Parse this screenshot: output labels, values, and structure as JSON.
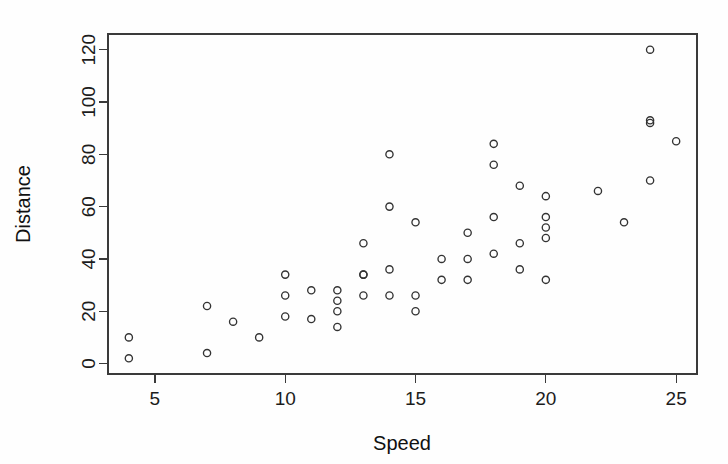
{
  "chart_data": {
    "type": "scatter",
    "title": "",
    "xlabel": "Speed",
    "ylabel": "Distance",
    "xlim": [
      3.2,
      25.8
    ],
    "ylim": [
      -4,
      126
    ],
    "grid": false,
    "legend": null,
    "marker": "open-circle",
    "marker_color": "#333333",
    "x_ticks": [
      5,
      10,
      15,
      20,
      25
    ],
    "x_tick_labels": [
      "5",
      "10",
      "15",
      "20",
      "25"
    ],
    "y_ticks": [
      0,
      20,
      40,
      60,
      80,
      100,
      120
    ],
    "y_tick_labels": [
      "0",
      "20",
      "40",
      "60",
      "80",
      "100",
      "120"
    ],
    "x": [
      4,
      4,
      7,
      7,
      8,
      9,
      10,
      10,
      10,
      11,
      11,
      12,
      12,
      12,
      12,
      13,
      13,
      13,
      13,
      14,
      14,
      14,
      14,
      15,
      15,
      15,
      16,
      16,
      17,
      17,
      17,
      18,
      18,
      18,
      18,
      19,
      19,
      19,
      20,
      20,
      20,
      20,
      20,
      22,
      23,
      24,
      24,
      24,
      24,
      25
    ],
    "y": [
      2,
      10,
      4,
      22,
      16,
      10,
      18,
      26,
      34,
      17,
      28,
      14,
      20,
      24,
      28,
      26,
      34,
      34,
      46,
      26,
      36,
      60,
      80,
      20,
      26,
      54,
      32,
      40,
      32,
      40,
      50,
      42,
      56,
      76,
      84,
      36,
      46,
      68,
      32,
      48,
      52,
      56,
      64,
      66,
      54,
      70,
      92,
      93,
      120,
      85
    ],
    "points": [
      {
        "speed": 4,
        "distance": 2
      },
      {
        "speed": 4,
        "distance": 10
      },
      {
        "speed": 7,
        "distance": 4
      },
      {
        "speed": 7,
        "distance": 22
      },
      {
        "speed": 8,
        "distance": 16
      },
      {
        "speed": 9,
        "distance": 10
      },
      {
        "speed": 10,
        "distance": 18
      },
      {
        "speed": 10,
        "distance": 26
      },
      {
        "speed": 10,
        "distance": 34
      },
      {
        "speed": 11,
        "distance": 17
      },
      {
        "speed": 11,
        "distance": 28
      },
      {
        "speed": 12,
        "distance": 14
      },
      {
        "speed": 12,
        "distance": 20
      },
      {
        "speed": 12,
        "distance": 24
      },
      {
        "speed": 12,
        "distance": 28
      },
      {
        "speed": 13,
        "distance": 26
      },
      {
        "speed": 13,
        "distance": 34
      },
      {
        "speed": 13,
        "distance": 34
      },
      {
        "speed": 13,
        "distance": 46
      },
      {
        "speed": 14,
        "distance": 26
      },
      {
        "speed": 14,
        "distance": 36
      },
      {
        "speed": 14,
        "distance": 60
      },
      {
        "speed": 14,
        "distance": 80
      },
      {
        "speed": 15,
        "distance": 20
      },
      {
        "speed": 15,
        "distance": 26
      },
      {
        "speed": 15,
        "distance": 54
      },
      {
        "speed": 16,
        "distance": 32
      },
      {
        "speed": 16,
        "distance": 40
      },
      {
        "speed": 17,
        "distance": 32
      },
      {
        "speed": 17,
        "distance": 40
      },
      {
        "speed": 17,
        "distance": 50
      },
      {
        "speed": 18,
        "distance": 42
      },
      {
        "speed": 18,
        "distance": 56
      },
      {
        "speed": 18,
        "distance": 76
      },
      {
        "speed": 18,
        "distance": 84
      },
      {
        "speed": 19,
        "distance": 36
      },
      {
        "speed": 19,
        "distance": 46
      },
      {
        "speed": 19,
        "distance": 68
      },
      {
        "speed": 20,
        "distance": 32
      },
      {
        "speed": 20,
        "distance": 48
      },
      {
        "speed": 20,
        "distance": 52
      },
      {
        "speed": 20,
        "distance": 56
      },
      {
        "speed": 20,
        "distance": 64
      },
      {
        "speed": 22,
        "distance": 66
      },
      {
        "speed": 23,
        "distance": 54
      },
      {
        "speed": 24,
        "distance": 70
      },
      {
        "speed": 24,
        "distance": 92
      },
      {
        "speed": 24,
        "distance": 93
      },
      {
        "speed": 24,
        "distance": 120
      },
      {
        "speed": 25,
        "distance": 85
      }
    ]
  },
  "axes": {
    "x_title": "Speed",
    "y_title": "Distance"
  },
  "colors": {
    "axis": "#3a3a3a",
    "text": "#1c1c1c",
    "marker": "#333333",
    "background": "#fefefe"
  }
}
